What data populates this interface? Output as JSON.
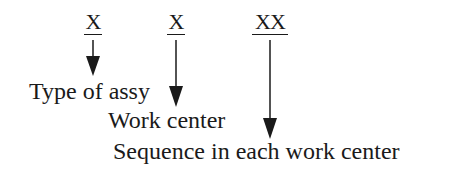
{
  "diagram": {
    "codes": [
      {
        "text": "X"
      },
      {
        "text": "X"
      },
      {
        "text": "XX"
      }
    ],
    "labels": [
      {
        "text": "Type of assy"
      },
      {
        "text": "Work center"
      },
      {
        "text": "Sequence in each work center"
      }
    ],
    "colors": {
      "ink": "#1a1a1a",
      "background": "#ffffff"
    }
  }
}
